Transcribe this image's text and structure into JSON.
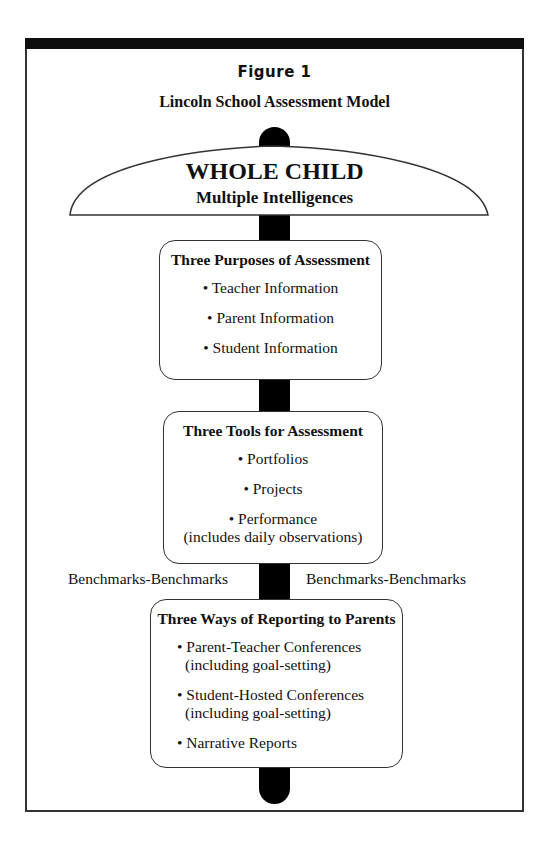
{
  "figure": {
    "label": "Figure 1",
    "title": "Lincoln School Assessment Model"
  },
  "umbrella": {
    "heading": "WHOLE CHILD",
    "subheading": "Multiple Intelligences"
  },
  "boxes": [
    {
      "title": "Three Purposes of Assessment",
      "items": [
        "• Teacher Information",
        "• Parent Information",
        "• Student Information"
      ]
    },
    {
      "title": "Three Tools for Assessment",
      "items": [
        "• Portfolios",
        "• Projects",
        "• Performance",
        "(includes daily observations)"
      ]
    },
    {
      "title": "Three Ways of Reporting to Parents",
      "items": [
        "• Parent-Teacher Conferences",
        "(including goal-setting)",
        "• Student-Hosted Conferences",
        "(including goal-setting)",
        "• Narrative Reports"
      ]
    }
  ],
  "benchmarks": {
    "left": "Benchmarks-Benchmarks",
    "right": "Benchmarks-Benchmarks"
  },
  "colors": {
    "line": "#333333",
    "pole": "#000000",
    "bar": "#0e0e0e"
  }
}
